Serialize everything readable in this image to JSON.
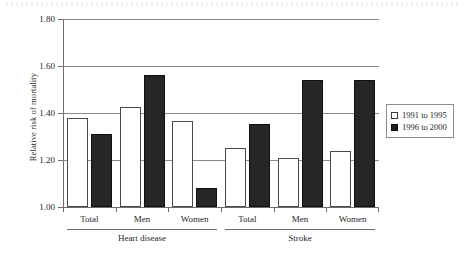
{
  "chart_data": {
    "type": "bar",
    "title": "",
    "xlabel": "",
    "ylabel": "Relative risk of mortality",
    "ylim": [
      1.0,
      1.8
    ],
    "ytick_labels": [
      "1.00",
      "1.20",
      "1.40",
      "1.60",
      "1.80"
    ],
    "ytick_values": [
      1.0,
      1.2,
      1.4,
      1.6,
      1.8
    ],
    "grid": true,
    "legend_position": "right",
    "categories": [
      "Total",
      "Men",
      "Women",
      "Total",
      "Men",
      "Women"
    ],
    "groups": [
      {
        "label": "Heart disease",
        "categories": [
          "Total",
          "Men",
          "Women"
        ]
      },
      {
        "label": "Stroke",
        "categories": [
          "Total",
          "Men",
          "Women"
        ]
      }
    ],
    "series": [
      {
        "name": "1991 to 1995",
        "style": "light",
        "color": "#ffffff",
        "values": [
          1.38,
          1.425,
          1.365,
          1.25,
          1.21,
          1.24
        ]
      },
      {
        "name": "1996 to 2000",
        "style": "dark",
        "color": "#262626",
        "values": [
          1.31,
          1.56,
          1.08,
          1.355,
          1.54,
          1.54
        ]
      }
    ]
  },
  "legend": {
    "entries": [
      {
        "label": "1991 to 1995",
        "style": "light"
      },
      {
        "label": "1996 to 2000",
        "style": "dark"
      }
    ]
  },
  "colors": {
    "series_light": "#ffffff",
    "series_dark": "#262626",
    "axis": "#6d6d6d",
    "grid": "#8a8a8a",
    "text": "#1f1f1f"
  }
}
